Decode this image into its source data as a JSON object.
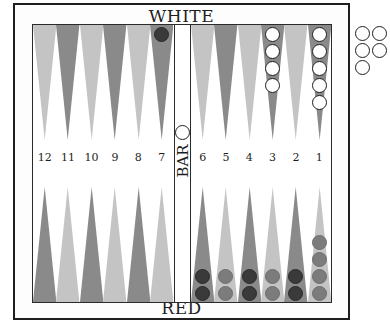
{
  "labels": {
    "top": "WHITE",
    "bottom": "RED",
    "bar": "BAR"
  },
  "colors": {
    "light_point": "#c4c4c4",
    "dark_point": "#8a8a8a",
    "white_checker": "#ffffff",
    "red_checker": "#7c7c7c",
    "black_checker": "#3a3a3a",
    "frame": "#1e1e1e"
  },
  "point_numbers": {
    "left": [
      "12",
      "11",
      "10",
      "9",
      "8",
      "7"
    ],
    "right": [
      "6",
      "5",
      "4",
      "3",
      "2",
      "1"
    ]
  },
  "top_points": {
    "left": [
      "light",
      "dark",
      "light",
      "dark",
      "light",
      "dark"
    ],
    "right": [
      "light",
      "dark",
      "light",
      "dark",
      "light",
      "dark"
    ]
  },
  "bottom_points": {
    "left": [
      "dark",
      "light",
      "dark",
      "light",
      "dark",
      "light"
    ],
    "right": [
      "dark",
      "light",
      "dark",
      "light",
      "dark",
      "light"
    ]
  },
  "checkers": {
    "point_7_top": {
      "color": "black",
      "count": 1
    },
    "point_3_top": {
      "color": "white",
      "count": 4
    },
    "point_1_top": {
      "color": "white",
      "count": 5
    },
    "bottom_right_col1": {
      "color": "black",
      "count": 2
    },
    "bottom_right_col2": {
      "color": "red",
      "count": 2
    },
    "bottom_right_col3": {
      "color": "black",
      "count": 2
    },
    "bottom_right_col4": {
      "color": "red",
      "count": 2
    },
    "bottom_right_col5": {
      "color": "black",
      "count": 2
    },
    "bottom_right_col6": {
      "color": "red",
      "count": 4
    },
    "bar": {
      "color": "white",
      "count": 1
    },
    "borne_off_white": {
      "color": "white",
      "count": 5
    }
  }
}
